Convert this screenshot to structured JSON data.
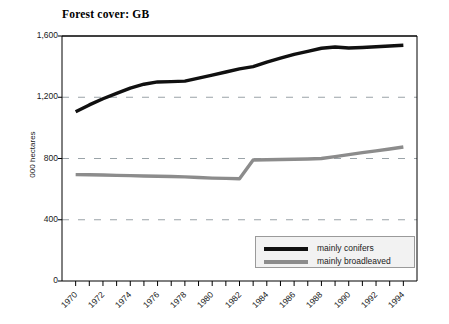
{
  "chart_data": {
    "type": "line",
    "title": "Forest cover: GB",
    "xlabel": "",
    "ylabel": "000 hectares",
    "ylim": [
      0,
      1600
    ],
    "xlim": [
      1969,
      1995
    ],
    "yticks": [
      0,
      400,
      800,
      1200,
      1600
    ],
    "ytick_labels": [
      "0",
      "400",
      "800",
      "1,200",
      "1,600"
    ],
    "xtick_labels": [
      "1970",
      "1972",
      "1974",
      "1976",
      "1978",
      "1980",
      "1982",
      "1984",
      "1986",
      "1988",
      "1990",
      "1992",
      "1994"
    ],
    "xtick_values": [
      1970,
      1972,
      1974,
      1976,
      1978,
      1980,
      1982,
      1984,
      1986,
      1988,
      1990,
      1992,
      1994
    ],
    "grid": "horizontal-dashed",
    "legend_position": "bottom-right",
    "x": [
      1970,
      1971,
      1972,
      1973,
      1974,
      1975,
      1976,
      1977,
      1978,
      1979,
      1980,
      1981,
      1982,
      1983,
      1984,
      1985,
      1986,
      1987,
      1988,
      1989,
      1990,
      1991,
      1992,
      1993,
      1994
    ],
    "series": [
      {
        "name": "mainly conifers",
        "color": "#101010",
        "values": [
          1105,
          1150,
          1190,
          1225,
          1260,
          1285,
          1300,
          1302,
          1305,
          1325,
          1345,
          1365,
          1385,
          1400,
          1430,
          1455,
          1480,
          1500,
          1520,
          1528,
          1522,
          1525,
          1530,
          1535,
          1540
        ]
      },
      {
        "name": "mainly broadleaved",
        "color": "#8c8c8c",
        "values": [
          695,
          694,
          692,
          690,
          688,
          686,
          684,
          682,
          680,
          676,
          672,
          670,
          668,
          790,
          792,
          793,
          795,
          797,
          800,
          812,
          825,
          838,
          850,
          862,
          875
        ]
      }
    ]
  },
  "legend": {
    "items": [
      {
        "label": "mainly conifers",
        "color": "#101010"
      },
      {
        "label": "mainly broadleaved",
        "color": "#8c8c8c"
      }
    ]
  }
}
